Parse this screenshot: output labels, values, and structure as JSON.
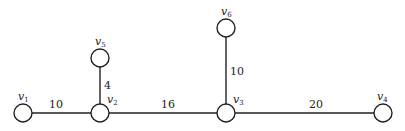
{
  "diagram": {
    "type": "weighted-tree",
    "nodes": [
      {
        "id": "v1",
        "label": "v",
        "sub": "1",
        "x": 23,
        "y": 113
      },
      {
        "id": "v2",
        "label": "v",
        "sub": "2",
        "x": 100,
        "y": 113
      },
      {
        "id": "v3",
        "label": "v",
        "sub": "3",
        "x": 226,
        "y": 113
      },
      {
        "id": "v4",
        "label": "v",
        "sub": "4",
        "x": 383,
        "y": 113
      },
      {
        "id": "v5",
        "label": "v",
        "sub": "5",
        "x": 100,
        "y": 58
      },
      {
        "id": "v6",
        "label": "v",
        "sub": "6",
        "x": 226,
        "y": 28
      }
    ],
    "edges": [
      {
        "from": "v1",
        "to": "v2",
        "weight": "10"
      },
      {
        "from": "v2",
        "to": "v5",
        "weight": "4"
      },
      {
        "from": "v2",
        "to": "v3",
        "weight": "16"
      },
      {
        "from": "v3",
        "to": "v6",
        "weight": "10"
      },
      {
        "from": "v3",
        "to": "v4",
        "weight": "20"
      }
    ]
  }
}
